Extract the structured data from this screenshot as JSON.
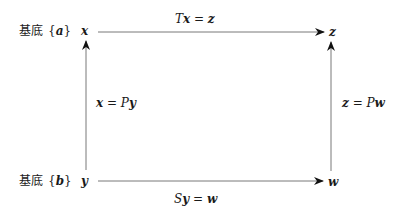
{
  "diagram": {
    "type": "commutative-diagram",
    "rows": [
      {
        "basis_label_prefix": "基底",
        "basis_label": "{a}",
        "basis_var": "a"
      },
      {
        "basis_label_prefix": "基底",
        "basis_label": "{b}",
        "basis_var": "b"
      }
    ],
    "nodes": {
      "top_left": "x",
      "top_right": "z",
      "bottom_left": "y",
      "bottom_right": "w"
    },
    "edges": [
      {
        "from": "x",
        "to": "z",
        "label": "Tx = z",
        "op": "T",
        "arg": "x",
        "result": "z"
      },
      {
        "from": "y",
        "to": "x",
        "label": "x = Py",
        "lhs": "x",
        "op": "P",
        "arg": "y"
      },
      {
        "from": "w",
        "to": "z",
        "label": "z = Pw",
        "lhs": "z",
        "op": "P",
        "arg": "w"
      },
      {
        "from": "y",
        "to": "w",
        "label": "Sy = w",
        "op": "S",
        "arg": "y",
        "result": "w"
      }
    ],
    "colors": {
      "line": "#333333",
      "text": "#1a1a1a"
    }
  }
}
